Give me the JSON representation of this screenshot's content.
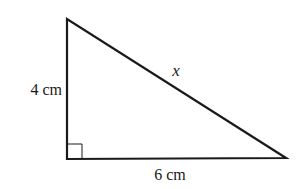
{
  "diagram": {
    "type": "right-triangle",
    "stroke_color": "#1a1a1a",
    "background": "#ffffff",
    "vertices": {
      "top": [
        67,
        19
      ],
      "right_angle": [
        67,
        159
      ],
      "right": [
        286,
        158
      ]
    },
    "right_angle_marker": {
      "corner": [
        67,
        159
      ],
      "size": 15
    },
    "labels": {
      "vertical_side": "4 cm",
      "horizontal_side": "6 cm",
      "hypotenuse": "x"
    }
  }
}
